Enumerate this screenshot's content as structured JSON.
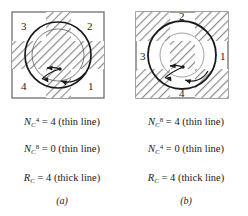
{
  "figure": {
    "panels": [
      {
        "id": "a",
        "caption": "(a)",
        "quadrant_labels": [
          {
            "name": "label-3",
            "text": "3",
            "position": "top-left"
          },
          {
            "name": "label-2",
            "text": "2",
            "position": "top-right"
          },
          {
            "name": "label-4",
            "text": "4",
            "position": "bottom-left"
          },
          {
            "name": "label-1",
            "text": "1",
            "position": "bottom-right"
          }
        ],
        "hatch_shape": "cross",
        "circles": [
          "thick-outer-circle",
          "thin-inner-circle"
        ],
        "marker": "center-dot",
        "arrows": [
          "curved-arrow-upper-left",
          "curved-arrow-lower-left",
          "curved-arrow-lower-right"
        ],
        "equations": [
          {
            "name": "equation-nc4",
            "symbol": "N",
            "subscript": "C",
            "superscript": "4",
            "equals": "= 4",
            "note": "(thin line)"
          },
          {
            "name": "equation-nc8",
            "symbol": "N",
            "subscript": "C",
            "superscript": "8",
            "equals": "= 0",
            "note": "(thin line)"
          },
          {
            "name": "equation-rc",
            "symbol": "R",
            "subscript": "C",
            "superscript": "",
            "equals": "= 4",
            "note": "(thick line)"
          }
        ]
      },
      {
        "id": "b",
        "caption": "(b)",
        "quadrant_labels": [
          {
            "name": "label-2",
            "text": "2",
            "position": "top-center"
          },
          {
            "name": "label-1",
            "text": "1",
            "position": "right-center"
          },
          {
            "name": "label-3",
            "text": "3",
            "position": "left-center"
          },
          {
            "name": "label-4",
            "text": "4",
            "position": "bottom-center"
          }
        ],
        "hatch_shape": "corners",
        "circles": [
          "thick-outer-circle",
          "thin-inner-circle"
        ],
        "marker": "center-dot",
        "arrows": [
          "curved-arrow-upper-left",
          "curved-arrow-lower-left",
          "curved-arrow-lower-right"
        ],
        "equations": [
          {
            "name": "equation-nc8",
            "symbol": "N",
            "subscript": "C",
            "superscript": "8",
            "equals": "= 4",
            "note": "(thin line)"
          },
          {
            "name": "equation-nc4",
            "symbol": "N",
            "subscript": "C",
            "superscript": "4",
            "equals": "= 0",
            "note": "(thin line)"
          },
          {
            "name": "equation-rc",
            "symbol": "R",
            "subscript": "C",
            "superscript": "",
            "equals": "= 4",
            "note": "(thick line)"
          }
        ]
      }
    ]
  },
  "colors": {
    "ink": "#1a1a1a",
    "hatch": "#8a8a8a",
    "border": "#6f6f6f",
    "background": "#ffffff"
  }
}
